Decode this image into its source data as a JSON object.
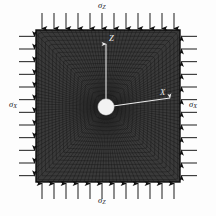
{
  "figure": {
    "name": "fea-plate-with-central-hole-biaxial-compression",
    "background_color": "#fdfdfd",
    "mesh": {
      "fill_color": "#3a3a3a",
      "line_color": "#121212",
      "border_color": "#101010",
      "plate": {
        "left": 36,
        "top": 30,
        "width": 144,
        "height": 152
      },
      "hole": {
        "cx": 106,
        "cy": 107,
        "r": 8.5,
        "fill": "#f2f2f2"
      },
      "radial_spokes": 132,
      "concentric_rings": 17
    },
    "axes": [
      {
        "name": "z-axis",
        "label": "Z",
        "direction": "up",
        "from": [
          106,
          107
        ],
        "to": [
          106,
          42
        ],
        "color": "#e8e8e8"
      },
      {
        "name": "x-axis",
        "label": "X",
        "direction": "right",
        "from": [
          106,
          107
        ],
        "to": [
          172,
          97
        ],
        "color": "#e8e8e8"
      }
    ],
    "loads": [
      {
        "name": "sigma-z-top",
        "label": "σ",
        "subscript": "Z",
        "edge": "top",
        "arrow_direction": "down",
        "count": 12,
        "color": "#101010"
      },
      {
        "name": "sigma-z-bottom",
        "label": "σ",
        "subscript": "Z",
        "edge": "bottom",
        "arrow_direction": "up",
        "count": 12,
        "color": "#101010"
      },
      {
        "name": "sigma-x-left",
        "label": "σ",
        "subscript": "X",
        "edge": "left",
        "arrow_direction": "right",
        "count": 12,
        "color": "#101010"
      },
      {
        "name": "sigma-x-right",
        "label": "σ",
        "subscript": "X",
        "edge": "right",
        "arrow_direction": "left",
        "count": 12,
        "color": "#101010"
      }
    ],
    "labels": {
      "sigma_z_top": {
        "base": "σ",
        "sub": "Z"
      },
      "sigma_z_bottom": {
        "base": "σ",
        "sub": "Z"
      },
      "sigma_x_left": {
        "base": "σ",
        "sub": "X"
      },
      "sigma_x_right": {
        "base": "σ",
        "sub": "X"
      },
      "axis_z": "Z",
      "axis_x": "X"
    }
  }
}
